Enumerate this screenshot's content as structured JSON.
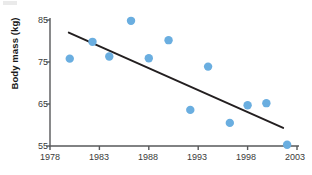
{
  "chart_data": {
    "type": "scatter",
    "title": "",
    "xlabel": "",
    "ylabel": "Body mass (kg)",
    "xlim": [
      1978,
      2003
    ],
    "ylim": [
      55,
      85
    ],
    "xticks": [
      1978,
      1983,
      1988,
      1993,
      1998,
      2003
    ],
    "yticks": [
      55,
      65,
      75,
      85
    ],
    "grid": false,
    "legend": null,
    "series": [
      {
        "name": "Body mass",
        "marker": "circle",
        "color": "#6aaee0",
        "points": [
          {
            "x": 1980.0,
            "y": 75.8
          },
          {
            "x": 1982.3,
            "y": 79.8
          },
          {
            "x": 1984.0,
            "y": 76.3
          },
          {
            "x": 1986.2,
            "y": 84.8
          },
          {
            "x": 1988.0,
            "y": 75.9
          },
          {
            "x": 1990.0,
            "y": 80.2
          },
          {
            "x": 1992.2,
            "y": 63.6
          },
          {
            "x": 1994.0,
            "y": 73.9
          },
          {
            "x": 1996.2,
            "y": 60.5
          },
          {
            "x": 1998.0,
            "y": 64.7
          },
          {
            "x": 1999.9,
            "y": 65.2
          },
          {
            "x": 2002.0,
            "y": 55.3
          }
        ]
      }
    ],
    "trendline": {
      "name": "linear fit",
      "color": "#231f20",
      "x0": 1979.9,
      "y0": 82.0,
      "x1": 2001.6,
      "y1": 59.3
    }
  },
  "axis": {
    "y_tick_labels": [
      "85",
      "75",
      "65",
      "55"
    ],
    "x_tick_labels": [
      "1978",
      "1983",
      "1988",
      "1993",
      "1998",
      "2003"
    ],
    "y_axis_title": "Body mass (kg)"
  },
  "style": {
    "marker_color": "#6aaee0",
    "trend_color": "#231f20",
    "axis_color": "#58595b",
    "text_color": "#3a3a3a"
  }
}
